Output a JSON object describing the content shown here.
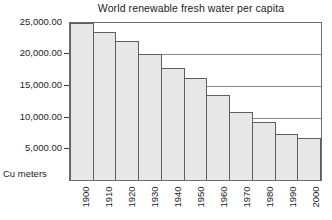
{
  "chart_data": {
    "type": "bar",
    "title": "World renewable fresh water per capita",
    "xlabel": "",
    "ylabel": "Cu meters",
    "categories": [
      "1900",
      "1910",
      "1920",
      "1930",
      "1940",
      "1950",
      "1960",
      "1970",
      "1980",
      "1990",
      "2000"
    ],
    "values": [
      25000,
      23500,
      22100,
      20000,
      17800,
      16300,
      13600,
      10900,
      9200,
      7400,
      6700
    ],
    "ylim": [
      0,
      25000
    ],
    "yticks": [
      5000,
      10000,
      15000,
      20000,
      25000
    ],
    "ytick_labels": [
      "5,000.00",
      "10,000.00",
      "15,000.00",
      "20,000.00",
      "25,000.00"
    ],
    "grid": true,
    "legend": "none",
    "bar_fill_color": "#e7e7e7",
    "bar_border_color": "#5f5f5f",
    "gridline_color": "#8a8a8a",
    "axis_color": "#6e6e6e"
  },
  "axes": {
    "unit_caption": "Cu meters"
  }
}
